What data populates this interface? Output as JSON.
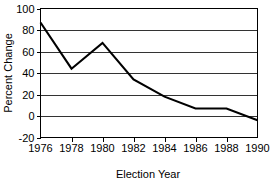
{
  "chart_data": {
    "type": "line",
    "title": "",
    "xlabel": "Election Year",
    "ylabel": "Percent Change",
    "x": [
      1976,
      1978,
      1980,
      1982,
      1984,
      1986,
      1988,
      1990
    ],
    "xtick_labels": [
      "1976",
      "1978",
      "1980",
      "1982",
      "1984",
      "1986",
      "1988",
      "1990"
    ],
    "values": [
      87,
      44,
      68,
      34,
      18,
      7,
      7,
      -4
    ],
    "series": [
      {
        "name": "Percent Change",
        "values": [
          87,
          44,
          68,
          34,
          18,
          7,
          7,
          -4
        ]
      }
    ],
    "xlim": [
      1976,
      1990
    ],
    "ylim": [
      -20,
      100
    ],
    "ytick_values": [
      100,
      80,
      60,
      40,
      20,
      0,
      -20
    ],
    "ytick_labels": [
      "100",
      "80",
      "60",
      "40",
      "20",
      "0",
      "-20"
    ],
    "grid": "horizontal",
    "legend": "none",
    "line_color": "#000000",
    "background_color": "#ffffff"
  }
}
